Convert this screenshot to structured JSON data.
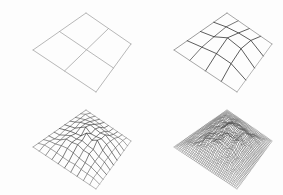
{
  "figure": {
    "description": "Four wireframe perspective views of a height-field surface at increasing mesh resolution, from a flat coarse quadrilateral patch to a finely subdivided rough mountainous terrain.",
    "background_color": "#fdfdfd",
    "line_color": "#8a8a8a",
    "dark_line_color": "#2b2b2b",
    "panel_count": 4,
    "columns": 2,
    "rows": 2,
    "width": 283,
    "height": 195
  },
  "panels": [
    {
      "id": "panel-0",
      "name": "coarse-2x2-mesh",
      "label": "",
      "divisions": 2,
      "roughness": 0.0,
      "amplitude": 0,
      "line_width": 0.7,
      "line_color": "#9a9a9a",
      "seed": 11,
      "stage": 1
    },
    {
      "id": "panel-1",
      "name": "mesh-4x4-subdivision",
      "label": "",
      "divisions": 4,
      "roughness": 0.55,
      "amplitude": 15,
      "line_width": 0.7,
      "line_color": "#8f8f8f",
      "seed": 23,
      "stage": 2
    },
    {
      "id": "panel-2",
      "name": "mesh-10x10-subdivision",
      "label": "",
      "divisions": 10,
      "roughness": 0.6,
      "amplitude": 17,
      "line_width": 0.6,
      "line_color": "#7d7d7d",
      "seed": 23,
      "stage": 3
    },
    {
      "id": "panel-3",
      "name": "mesh-40x40-subdivision",
      "label": "",
      "divisions": 40,
      "roughness": 0.62,
      "amplitude": 18,
      "line_width": 0.45,
      "line_color": "#4a4a4a",
      "seed": 23,
      "stage": 4
    }
  ],
  "chart_data": {
    "type": "line",
    "subtitle": "",
    "xlabel": "",
    "ylabel": "",
    "grid": false,
    "legend_position": "none",
    "categories": [
      "stage 1",
      "stage 2",
      "stage 3",
      "stage 4"
    ],
    "series": [
      {
        "name": "mesh divisions per side",
        "values": [
          2,
          4,
          10,
          40
        ]
      },
      {
        "name": "height amplitude (px)",
        "values": [
          0,
          15,
          17,
          18
        ]
      }
    ],
    "projection": {
      "name": "oblique-perspective",
      "corner_top": [
        86,
        13
      ],
      "corner_right": [
        131,
        44
      ],
      "corner_bottom": [
        96,
        92
      ],
      "corner_left": [
        33,
        50
      ]
    }
  }
}
